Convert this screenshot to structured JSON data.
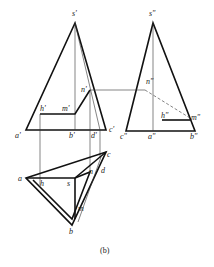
{
  "figure": {
    "caption": "(b)",
    "front_view": {
      "labels": {
        "s": "s'",
        "a": "a'",
        "b": "b'",
        "c": "c'",
        "d": "d'",
        "h": "h'",
        "m": "m'",
        "n": "n'"
      }
    },
    "side_view": {
      "labels": {
        "s": "s\"",
        "a": "a\"",
        "b": "b\"",
        "c": "c\"",
        "h": "h\"",
        "m": "m\"",
        "n": "n\""
      }
    },
    "top_view": {
      "labels": {
        "s": "s",
        "a": "a",
        "b": "b",
        "c": "c",
        "d": "d",
        "h": "h",
        "m": "m",
        "n": "n"
      }
    }
  }
}
